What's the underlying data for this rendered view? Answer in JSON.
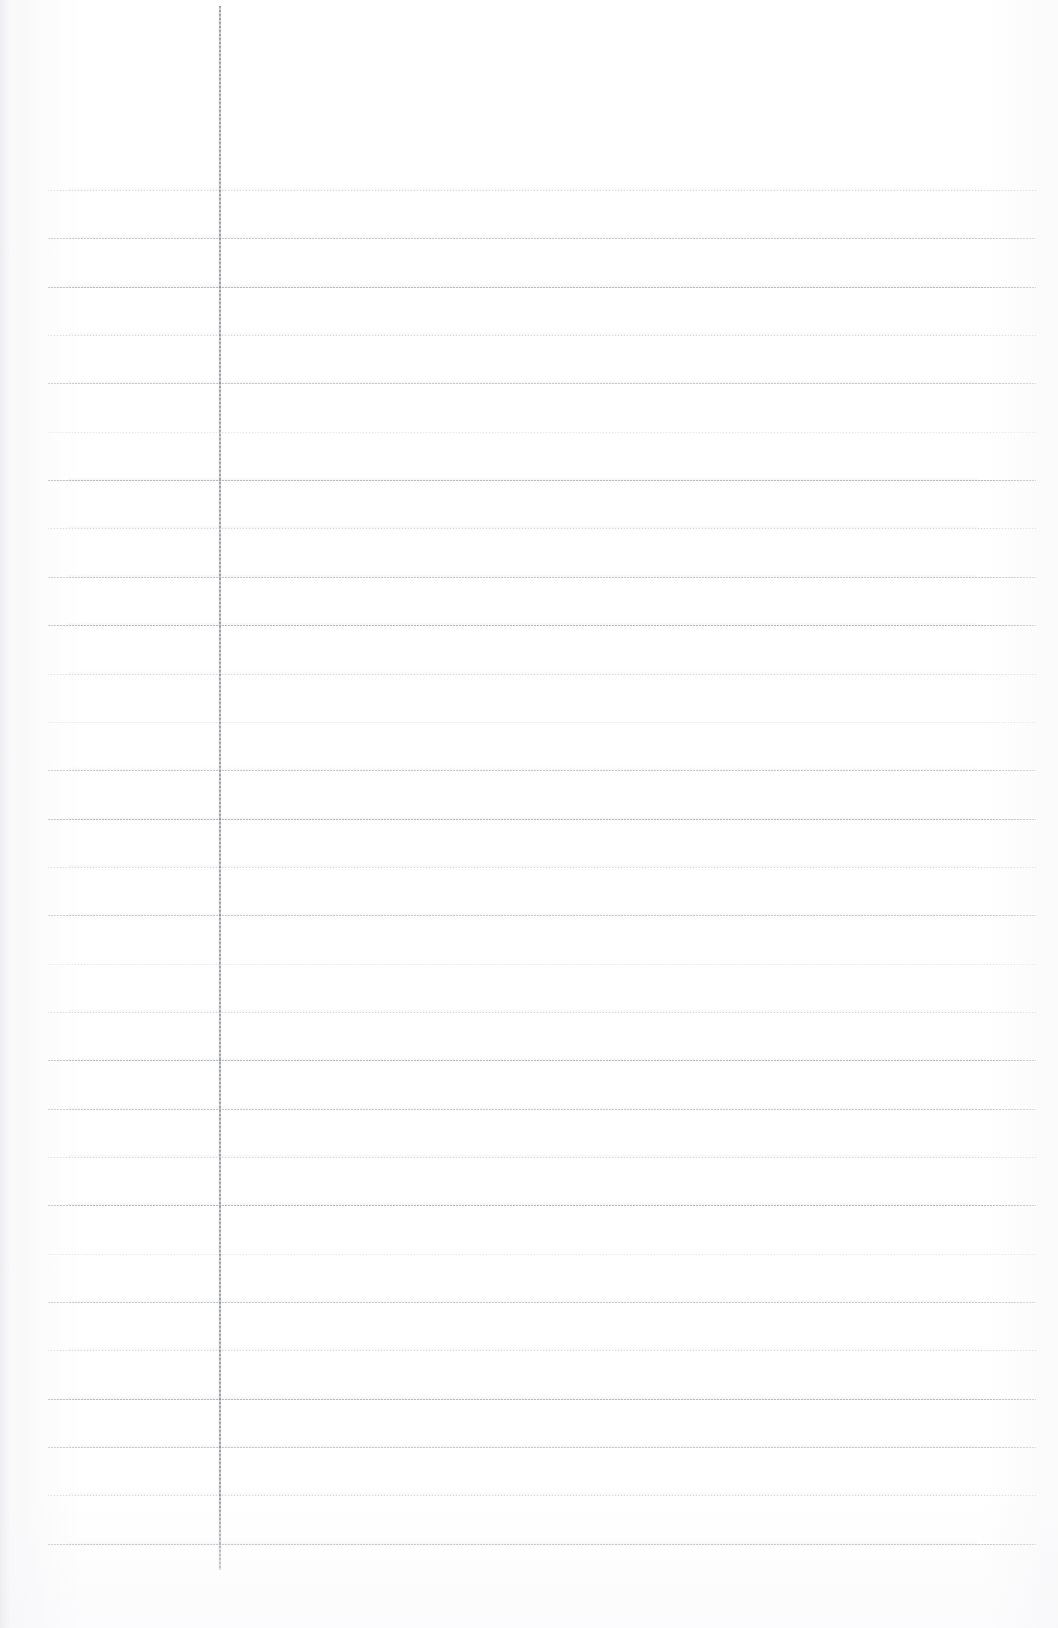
{
  "document": {
    "type": "scanned-ruled-notebook-page",
    "title": "",
    "page_width": 1058,
    "page_height": 1628,
    "background_color": "#ffffff",
    "visible_text": [],
    "handwriting": [],
    "notes": "Blank lined (ruled) paper page. No text, headings, numbers, icons or controls are rendered in the pixels."
  },
  "ruling": {
    "horizontal_line_color": "#7d8087",
    "horizontal_line_left": 48,
    "horizontal_line_right": 1036,
    "horizontal_line_first_y": 190,
    "horizontal_line_spacing": 48.35,
    "horizontal_line_count": 29,
    "horizontal_line_thickness": 1,
    "line_weights": [
      1,
      0,
      2,
      1,
      0,
      3,
      2,
      1,
      0,
      2,
      1,
      3,
      0,
      2,
      1,
      0,
      3,
      1,
      2,
      0,
      1,
      2,
      3,
      0,
      1,
      2,
      0,
      1,
      2
    ],
    "margin_rule_color": "#6e717a",
    "margin_rule_x": 219,
    "margin_rule_top": 6,
    "margin_rule_bottom": 1570,
    "margin_rule_thickness": 2
  }
}
